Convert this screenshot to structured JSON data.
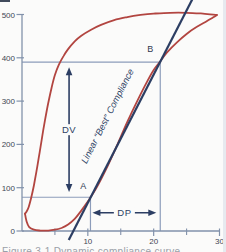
{
  "caption_fragment": "Figure 3-1 Dynamic compliance curve",
  "artifacts": {
    "top_left_mark_color": "#414b5c",
    "right_edge_strip_color": "#e7eaef"
  },
  "chart_data": {
    "type": "line",
    "title": "",
    "xlabel": "",
    "ylabel": "",
    "xlim": [
      0,
      30
    ],
    "ylim": [
      0,
      500
    ],
    "x_ticks_labeled": [
      10,
      20,
      30
    ],
    "x_ticks_minor": [
      5,
      15,
      25
    ],
    "y_ticks_labeled": [
      0,
      100,
      200,
      300,
      400,
      500
    ],
    "grid": false,
    "legend": "none",
    "colors": {
      "loop": "#b24540",
      "line": "#2c3e63",
      "guides": "#8c9cba",
      "axis": "#8292ab",
      "tick_text": "#3f4654",
      "annotation_text": "#2c3e63",
      "point_label_text": "#2f3a50",
      "caption_text": "#9aa0a8",
      "background": "#fbfbfa"
    },
    "series": [
      {
        "name": "inspiration-limb",
        "role": "loop",
        "points": [
          [
            0.45,
            40
          ],
          [
            0.7,
            22
          ],
          [
            1.1,
            9
          ],
          [
            1.8,
            3
          ],
          [
            2.8,
            1
          ],
          [
            4,
            1
          ],
          [
            5,
            3
          ],
          [
            6,
            7
          ],
          [
            7,
            15
          ],
          [
            8,
            28
          ],
          [
            9,
            47
          ],
          [
            10,
            68
          ],
          [
            10.5,
            80
          ],
          [
            11.5,
            105
          ],
          [
            13,
            150
          ],
          [
            14.5,
            200
          ],
          [
            16,
            252
          ],
          [
            17.5,
            300
          ],
          [
            19,
            345
          ],
          [
            20,
            372
          ],
          [
            21,
            392
          ],
          [
            22,
            412
          ],
          [
            23.5,
            435
          ],
          [
            25,
            455
          ],
          [
            26.5,
            471
          ],
          [
            28,
            484
          ],
          [
            29,
            493
          ],
          [
            29.6,
            499
          ]
        ]
      },
      {
        "name": "expiration-limb",
        "role": "loop",
        "points": [
          [
            29.6,
            499
          ],
          [
            27.5,
            502
          ],
          [
            25,
            504
          ],
          [
            22.5,
            504
          ],
          [
            20,
            502
          ],
          [
            18,
            499
          ],
          [
            16,
            494
          ],
          [
            14,
            487
          ],
          [
            12,
            476
          ],
          [
            10.5,
            465
          ],
          [
            9,
            451
          ],
          [
            8,
            438
          ],
          [
            7,
            420
          ],
          [
            6.3,
            404
          ],
          [
            5.6,
            384
          ],
          [
            5,
            360
          ],
          [
            4.5,
            331
          ],
          [
            4,
            296
          ],
          [
            3.5,
            256
          ],
          [
            3,
            212
          ],
          [
            2.6,
            174
          ],
          [
            2.2,
            138
          ],
          [
            1.8,
            105
          ],
          [
            1.4,
            77
          ],
          [
            1,
            55
          ],
          [
            0.7,
            45
          ],
          [
            0.45,
            40
          ]
        ]
      },
      {
        "name": "best-compliance-line",
        "role": "line",
        "points": [
          [
            7.1,
            -21
          ],
          [
            25.9,
            536
          ]
        ]
      }
    ],
    "annotations": {
      "point_a": {
        "label": "A",
        "x": 10.4,
        "y": 78,
        "label_x": 9.3,
        "label_y": 104
      },
      "point_b": {
        "label": "B",
        "x": 21.0,
        "y": 390,
        "label_x": 19.5,
        "label_y": 420
      },
      "guides": [
        {
          "type": "h",
          "y": 390,
          "x0": 0,
          "x1": 21
        },
        {
          "type": "v",
          "x": 21,
          "y0": 0,
          "y1": 390
        },
        {
          "type": "h",
          "y": 78,
          "x0": 0,
          "x1": 10.4
        },
        {
          "type": "v",
          "x": 10.4,
          "y0": 0,
          "y1": 78
        }
      ],
      "dv_arrow": {
        "label": "DV",
        "x": 7.15,
        "y0": 90,
        "y1": 378
      },
      "dp_arrow": {
        "label": "DP",
        "y": 42,
        "x0": 10.7,
        "x1": 20.4
      },
      "line_label": {
        "text": "Linear “Best” Compliance",
        "x": 13.4,
        "y": 262,
        "rotation_deg": -63
      }
    }
  }
}
